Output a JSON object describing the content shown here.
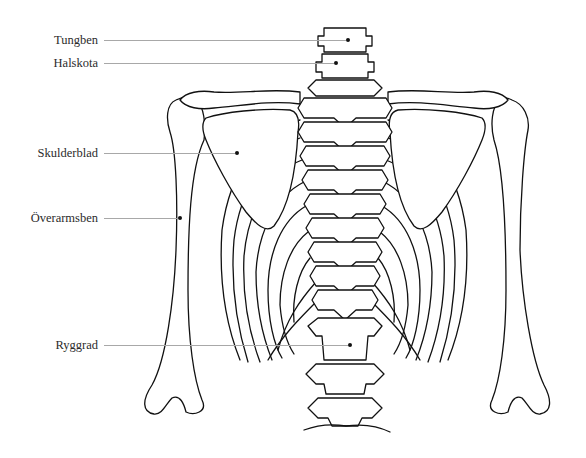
{
  "diagram": {
    "type": "anatomical illustration",
    "line_color": "#111111",
    "leader_color": "#a8a8a8",
    "background": "#ffffff",
    "labels": [
      {
        "id": "tungben",
        "text": "Tungben",
        "label_right": 98,
        "y": 40,
        "dot": [
          348,
          40
        ]
      },
      {
        "id": "halskota",
        "text": "Halskota",
        "label_right": 98,
        "y": 63,
        "dot": [
          336,
          63
        ]
      },
      {
        "id": "skulderblad",
        "text": "Skulderblad",
        "label_right": 98,
        "y": 153,
        "dot": [
          237,
          153
        ]
      },
      {
        "id": "overarmsben",
        "text": "Överarmsben",
        "label_right": 98,
        "y": 218,
        "dot": [
          180,
          218
        ]
      },
      {
        "id": "ryggrad",
        "text": "Ryggrad",
        "label_right": 98,
        "y": 345,
        "dot": [
          350,
          345
        ]
      }
    ]
  }
}
